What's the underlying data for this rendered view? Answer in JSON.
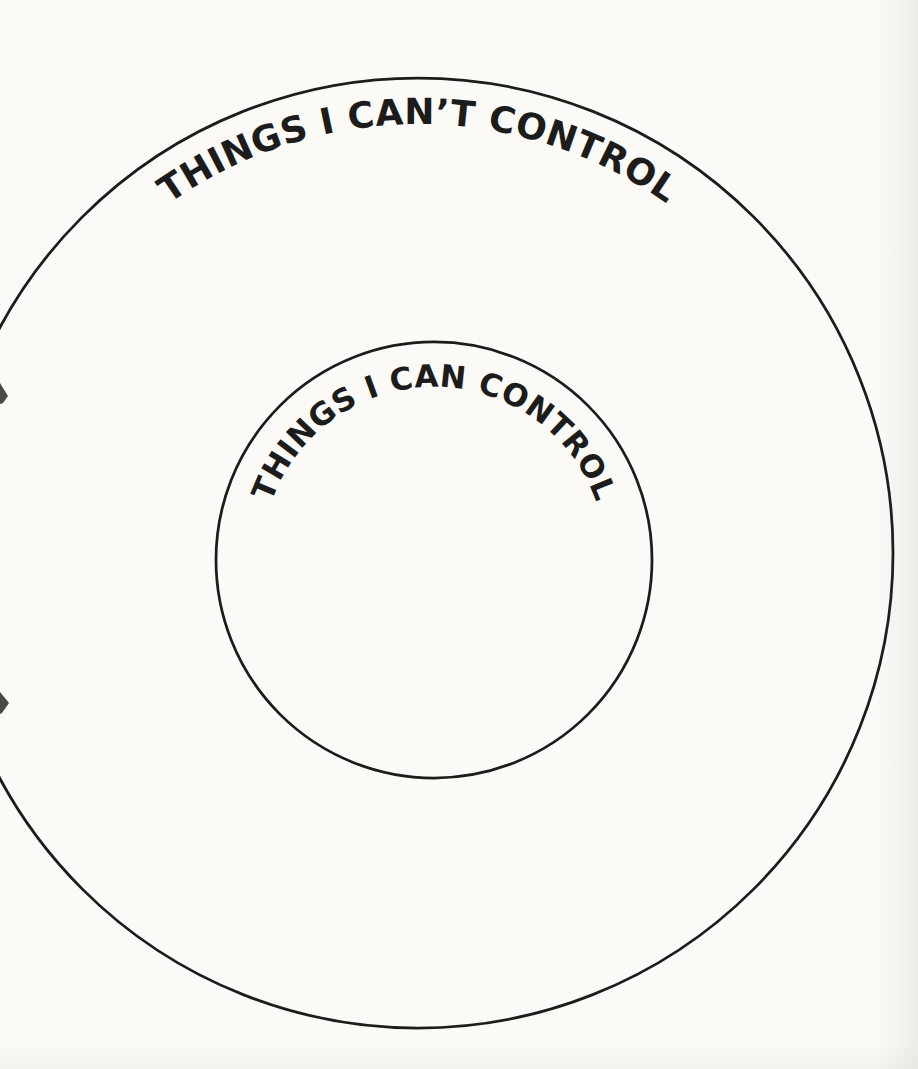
{
  "page": {
    "background_color": "#fbfaf7",
    "ink_color": "#1c1c1c"
  },
  "diagram": {
    "type": "concentric-circles",
    "outer_circle": {
      "label": "THINGS I CAN’T CONTROL"
    },
    "inner_circle": {
      "label": "THINGS I CAN CONTROL"
    }
  }
}
